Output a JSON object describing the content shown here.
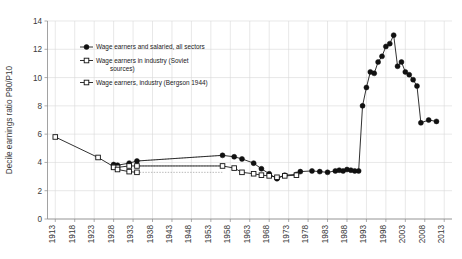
{
  "chart_data": {
    "type": "line",
    "title": "",
    "xlabel": "",
    "ylabel": "Decile earnings ratio P90/P10",
    "xlim": [
      1911,
      2015
    ],
    "ylim": [
      0,
      14
    ],
    "yticks": [
      0,
      2,
      4,
      6,
      8,
      10,
      12,
      14
    ],
    "xticks": [
      1913,
      1918,
      1923,
      1928,
      1933,
      1938,
      1943,
      1948,
      1953,
      1958,
      1963,
      1968,
      1973,
      1978,
      1983,
      1988,
      1993,
      1998,
      2003,
      2008,
      2013
    ],
    "grid": true,
    "legend_position": "top-left-inside",
    "series": [
      {
        "name": "Wage earners and salaried, all sectors",
        "marker": "filled-circle",
        "line": "solid",
        "points": [
          [
            1928,
            3.85
          ],
          [
            1929,
            3.8
          ],
          [
            1932,
            3.95
          ],
          [
            1934,
            4.1
          ],
          [
            1956,
            4.5
          ],
          [
            1959,
            4.4
          ],
          [
            1961,
            4.25
          ],
          [
            1964,
            3.95
          ],
          [
            1966,
            3.55
          ],
          [
            1968,
            3.2
          ],
          [
            1970,
            2.85
          ],
          [
            1972,
            3.1
          ],
          [
            1975,
            3.15
          ],
          [
            1976,
            3.35
          ],
          [
            1979,
            3.4
          ],
          [
            1981,
            3.35
          ],
          [
            1983,
            3.3
          ],
          [
            1985,
            3.4
          ],
          [
            1986,
            3.45
          ],
          [
            1987,
            3.4
          ],
          [
            1988,
            3.5
          ],
          [
            1989,
            3.45
          ],
          [
            1990,
            3.4
          ],
          [
            1991,
            3.4
          ],
          [
            1992,
            8.0
          ],
          [
            1993,
            9.3
          ],
          [
            1994,
            10.4
          ],
          [
            1995,
            10.3
          ],
          [
            1996,
            11.1
          ],
          [
            1997,
            11.5
          ],
          [
            1998,
            12.2
          ],
          [
            1999,
            12.4
          ],
          [
            2000,
            13.0
          ],
          [
            2001,
            10.8
          ],
          [
            2002,
            11.1
          ],
          [
            2003,
            10.4
          ],
          [
            2004,
            10.2
          ],
          [
            2005,
            9.85
          ],
          [
            2006,
            9.4
          ],
          [
            2007,
            6.8
          ],
          [
            2009,
            7.0
          ],
          [
            2011,
            6.9
          ]
        ]
      },
      {
        "name": "Wage earners in industry (Soviet sources)",
        "marker": "open-square",
        "line": "solid",
        "points": [
          [
            1913,
            5.8
          ],
          [
            1924,
            4.35
          ],
          [
            1928,
            3.7
          ],
          [
            1929,
            3.65
          ],
          [
            1932,
            3.75
          ],
          [
            1934,
            3.75
          ],
          [
            1956,
            3.75
          ],
          [
            1959,
            3.6
          ],
          [
            1961,
            3.3
          ],
          [
            1964,
            3.2
          ],
          [
            1966,
            3.1
          ],
          [
            1968,
            3.05
          ],
          [
            1970,
            2.95
          ],
          [
            1972,
            3.05
          ],
          [
            1975,
            3.1
          ]
        ]
      },
      {
        "name": "Wage earners, industry (Bergson 1944)",
        "marker": "open-square",
        "line": "solid",
        "points": [
          [
            1928,
            3.65
          ],
          [
            1929,
            3.5
          ],
          [
            1932,
            3.35
          ],
          [
            1934,
            3.3
          ]
        ]
      }
    ],
    "connectors": [
      {
        "from": [
          1934,
          4.1
        ],
        "to": [
          1956,
          4.5
        ],
        "style": "dotted"
      },
      {
        "from": [
          1934,
          3.75
        ],
        "to": [
          1956,
          3.75
        ],
        "style": "dotted"
      },
      {
        "from": [
          1934,
          3.3
        ],
        "to": [
          1956,
          3.3
        ],
        "style": "dotted"
      }
    ]
  },
  "legend": {
    "items": [
      {
        "label": "Wage earners and salaried, all sectors",
        "marker": "filled-circle"
      },
      {
        "label": "Wage earners in industry (Soviet",
        "label2": "sources)",
        "marker": "open-square"
      },
      {
        "label": "Wage earners, industry (Bergson 1944)",
        "marker": "open-square"
      }
    ]
  },
  "axis": {
    "y_title": "Decile earnings ratio P90/P10"
  },
  "colors": {
    "marker_fill": "#111111",
    "line": "#1a1a1a",
    "grid": "#d8d8d8",
    "axis": "#8a8a8a",
    "background": "#ffffff"
  }
}
